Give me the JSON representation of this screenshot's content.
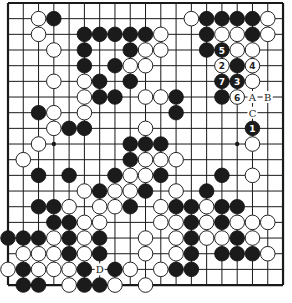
{
  "board": {
    "size": 19,
    "origin_x": 8,
    "origin_y": 3,
    "step_x": 15.28,
    "step_y": 15.67,
    "stone_radius": 7.3,
    "colors": {
      "black": "#1b1b1b",
      "white": "#ffffff",
      "line": "#1a1a1a"
    },
    "star_points": [
      [
        3,
        9
      ],
      [
        15,
        9
      ]
    ],
    "stones": [
      {
        "c": 2,
        "r": 1,
        "color": "white"
      },
      {
        "c": 3,
        "r": 1,
        "color": "black"
      },
      {
        "c": 12,
        "r": 1,
        "color": "white"
      },
      {
        "c": 13,
        "r": 1,
        "color": "black"
      },
      {
        "c": 14,
        "r": 1,
        "color": "black"
      },
      {
        "c": 15,
        "r": 1,
        "color": "black"
      },
      {
        "c": 16,
        "r": 1,
        "color": "black"
      },
      {
        "c": 17,
        "r": 1,
        "color": "white"
      },
      {
        "c": 2,
        "r": 2,
        "color": "white"
      },
      {
        "c": 5,
        "r": 2,
        "color": "black"
      },
      {
        "c": 6,
        "r": 2,
        "color": "black"
      },
      {
        "c": 7,
        "r": 2,
        "color": "black"
      },
      {
        "c": 8,
        "r": 2,
        "color": "black"
      },
      {
        "c": 9,
        "r": 2,
        "color": "black"
      },
      {
        "c": 10,
        "r": 2,
        "color": "white"
      },
      {
        "c": 13,
        "r": 2,
        "color": "black"
      },
      {
        "c": 14,
        "r": 2,
        "color": "white"
      },
      {
        "c": 15,
        "r": 2,
        "color": "white"
      },
      {
        "c": 16,
        "r": 2,
        "color": "black"
      },
      {
        "c": 17,
        "r": 2,
        "color": "white"
      },
      {
        "c": 3,
        "r": 3,
        "color": "white"
      },
      {
        "c": 5,
        "r": 3,
        "color": "black"
      },
      {
        "c": 8,
        "r": 3,
        "color": "black"
      },
      {
        "c": 9,
        "r": 3,
        "color": "white"
      },
      {
        "c": 10,
        "r": 3,
        "color": "white"
      },
      {
        "c": 13,
        "r": 3,
        "color": "black"
      },
      {
        "c": 14,
        "r": 3,
        "color": "black",
        "num": "5"
      },
      {
        "c": 15,
        "r": 3,
        "color": "white"
      },
      {
        "c": 16,
        "r": 3,
        "color": "white"
      },
      {
        "c": 5,
        "r": 4,
        "color": "black"
      },
      {
        "c": 7,
        "r": 4,
        "color": "black"
      },
      {
        "c": 8,
        "r": 4,
        "color": "white"
      },
      {
        "c": 9,
        "r": 4,
        "color": "white"
      },
      {
        "c": 14,
        "r": 4,
        "color": "white",
        "num": "2"
      },
      {
        "c": 15,
        "r": 4,
        "color": "black"
      },
      {
        "c": 16,
        "r": 4,
        "color": "white",
        "num": "4"
      },
      {
        "c": 3,
        "r": 5,
        "color": "white"
      },
      {
        "c": 5,
        "r": 5,
        "color": "white"
      },
      {
        "c": 6,
        "r": 5,
        "color": "black"
      },
      {
        "c": 8,
        "r": 5,
        "color": "black"
      },
      {
        "c": 14,
        "r": 5,
        "color": "black",
        "num": "7"
      },
      {
        "c": 15,
        "r": 5,
        "color": "black",
        "num": "3"
      },
      {
        "c": 16,
        "r": 5,
        "color": "white"
      },
      {
        "c": 5,
        "r": 6,
        "color": "white"
      },
      {
        "c": 6,
        "r": 6,
        "color": "black"
      },
      {
        "c": 7,
        "r": 6,
        "color": "black"
      },
      {
        "c": 9,
        "r": 6,
        "color": "white"
      },
      {
        "c": 10,
        "r": 6,
        "color": "white"
      },
      {
        "c": 11,
        "r": 6,
        "color": "black"
      },
      {
        "c": 14,
        "r": 6,
        "color": "black"
      },
      {
        "c": 15,
        "r": 6,
        "color": "white",
        "num": "6"
      },
      {
        "c": 2,
        "r": 7,
        "color": "black"
      },
      {
        "c": 3,
        "r": 7,
        "color": "white"
      },
      {
        "c": 5,
        "r": 7,
        "color": "white"
      },
      {
        "c": 11,
        "r": 7,
        "color": "black"
      },
      {
        "c": 3,
        "r": 8,
        "color": "white"
      },
      {
        "c": 4,
        "r": 8,
        "color": "black"
      },
      {
        "c": 5,
        "r": 8,
        "color": "black"
      },
      {
        "c": 9,
        "r": 8,
        "color": "white"
      },
      {
        "c": 16,
        "r": 8,
        "color": "black",
        "num": "1"
      },
      {
        "c": 2,
        "r": 9,
        "color": "white"
      },
      {
        "c": 8,
        "r": 9,
        "color": "black"
      },
      {
        "c": 9,
        "r": 9,
        "color": "black"
      },
      {
        "c": 10,
        "r": 9,
        "color": "black"
      },
      {
        "c": 16,
        "r": 9,
        "color": "white"
      },
      {
        "c": 1,
        "r": 10,
        "color": "white"
      },
      {
        "c": 8,
        "r": 10,
        "color": "black"
      },
      {
        "c": 9,
        "r": 10,
        "color": "white"
      },
      {
        "c": 10,
        "r": 10,
        "color": "white"
      },
      {
        "c": 11,
        "r": 10,
        "color": "white"
      },
      {
        "c": 2,
        "r": 11,
        "color": "black"
      },
      {
        "c": 4,
        "r": 11,
        "color": "black"
      },
      {
        "c": 7,
        "r": 11,
        "color": "black"
      },
      {
        "c": 8,
        "r": 11,
        "color": "white"
      },
      {
        "c": 9,
        "r": 11,
        "color": "white"
      },
      {
        "c": 10,
        "r": 11,
        "color": "black"
      },
      {
        "c": 14,
        "r": 11,
        "color": "black"
      },
      {
        "c": 16,
        "r": 11,
        "color": "white"
      },
      {
        "c": 5,
        "r": 12,
        "color": "white"
      },
      {
        "c": 6,
        "r": 12,
        "color": "black"
      },
      {
        "c": 7,
        "r": 12,
        "color": "white"
      },
      {
        "c": 8,
        "r": 12,
        "color": "white"
      },
      {
        "c": 9,
        "r": 12,
        "color": "black"
      },
      {
        "c": 11,
        "r": 12,
        "color": "white"
      },
      {
        "c": 13,
        "r": 12,
        "color": "black"
      },
      {
        "c": 2,
        "r": 13,
        "color": "black"
      },
      {
        "c": 3,
        "r": 13,
        "color": "black"
      },
      {
        "c": 4,
        "r": 13,
        "color": "white"
      },
      {
        "c": 6,
        "r": 13,
        "color": "white"
      },
      {
        "c": 7,
        "r": 13,
        "color": "white"
      },
      {
        "c": 8,
        "r": 13,
        "color": "black"
      },
      {
        "c": 10,
        "r": 13,
        "color": "white"
      },
      {
        "c": 11,
        "r": 13,
        "color": "black"
      },
      {
        "c": 12,
        "r": 13,
        "color": "black"
      },
      {
        "c": 13,
        "r": 13,
        "color": "white"
      },
      {
        "c": 14,
        "r": 13,
        "color": "black"
      },
      {
        "c": 15,
        "r": 13,
        "color": "black"
      },
      {
        "c": 3,
        "r": 14,
        "color": "black"
      },
      {
        "c": 4,
        "r": 14,
        "color": "black"
      },
      {
        "c": 5,
        "r": 14,
        "color": "white"
      },
      {
        "c": 6,
        "r": 14,
        "color": "white"
      },
      {
        "c": 10,
        "r": 14,
        "color": "white"
      },
      {
        "c": 11,
        "r": 14,
        "color": "white"
      },
      {
        "c": 12,
        "r": 14,
        "color": "black"
      },
      {
        "c": 13,
        "r": 14,
        "color": "white"
      },
      {
        "c": 14,
        "r": 14,
        "color": "black"
      },
      {
        "c": 15,
        "r": 14,
        "color": "white"
      },
      {
        "c": 16,
        "r": 14,
        "color": "white"
      },
      {
        "c": 17,
        "r": 14,
        "color": "white"
      },
      {
        "c": 0,
        "r": 15,
        "color": "black"
      },
      {
        "c": 1,
        "r": 15,
        "color": "black"
      },
      {
        "c": 2,
        "r": 15,
        "color": "black"
      },
      {
        "c": 3,
        "r": 15,
        "color": "white"
      },
      {
        "c": 4,
        "r": 15,
        "color": "black"
      },
      {
        "c": 5,
        "r": 15,
        "color": "white"
      },
      {
        "c": 6,
        "r": 15,
        "color": "black"
      },
      {
        "c": 9,
        "r": 15,
        "color": "white"
      },
      {
        "c": 11,
        "r": 15,
        "color": "white"
      },
      {
        "c": 12,
        "r": 15,
        "color": "black"
      },
      {
        "c": 13,
        "r": 15,
        "color": "white"
      },
      {
        "c": 14,
        "r": 15,
        "color": "white"
      },
      {
        "c": 15,
        "r": 15,
        "color": "black"
      },
      {
        "c": 16,
        "r": 15,
        "color": "white"
      },
      {
        "c": 1,
        "r": 16,
        "color": "white"
      },
      {
        "c": 2,
        "r": 16,
        "color": "white"
      },
      {
        "c": 3,
        "r": 16,
        "color": "white"
      },
      {
        "c": 4,
        "r": 16,
        "color": "black"
      },
      {
        "c": 5,
        "r": 16,
        "color": "white"
      },
      {
        "c": 6,
        "r": 16,
        "color": "black"
      },
      {
        "c": 9,
        "r": 16,
        "color": "white"
      },
      {
        "c": 11,
        "r": 16,
        "color": "white"
      },
      {
        "c": 12,
        "r": 16,
        "color": "black"
      },
      {
        "c": 14,
        "r": 16,
        "color": "black"
      },
      {
        "c": 15,
        "r": 16,
        "color": "black"
      },
      {
        "c": 16,
        "r": 16,
        "color": "black"
      },
      {
        "c": 17,
        "r": 16,
        "color": "white"
      },
      {
        "c": 0,
        "r": 17,
        "color": "white"
      },
      {
        "c": 1,
        "r": 17,
        "color": "black"
      },
      {
        "c": 2,
        "r": 17,
        "color": "white"
      },
      {
        "c": 3,
        "r": 17,
        "color": "white"
      },
      {
        "c": 4,
        "r": 17,
        "color": "white"
      },
      {
        "c": 5,
        "r": 17,
        "color": "black"
      },
      {
        "c": 7,
        "r": 17,
        "color": "black"
      },
      {
        "c": 8,
        "r": 17,
        "color": "white"
      },
      {
        "c": 10,
        "r": 17,
        "color": "white"
      },
      {
        "c": 11,
        "r": 17,
        "color": "black"
      },
      {
        "c": 12,
        "r": 17,
        "color": "black"
      },
      {
        "c": 1,
        "r": 18,
        "color": "black"
      },
      {
        "c": 2,
        "r": 18,
        "color": "black"
      },
      {
        "c": 4,
        "r": 18,
        "color": "white"
      },
      {
        "c": 5,
        "r": 18,
        "color": "black"
      },
      {
        "c": 6,
        "r": 18,
        "color": "black"
      },
      {
        "c": 7,
        "r": 18,
        "color": "white"
      },
      {
        "c": 9,
        "r": 18,
        "color": "white"
      }
    ],
    "labels": [
      {
        "c": 16,
        "r": 6,
        "text": "A"
      },
      {
        "c": 17,
        "r": 6,
        "text": "B"
      },
      {
        "c": 16,
        "r": 7,
        "text": "C"
      },
      {
        "c": 6,
        "r": 17,
        "text": "D"
      }
    ]
  }
}
